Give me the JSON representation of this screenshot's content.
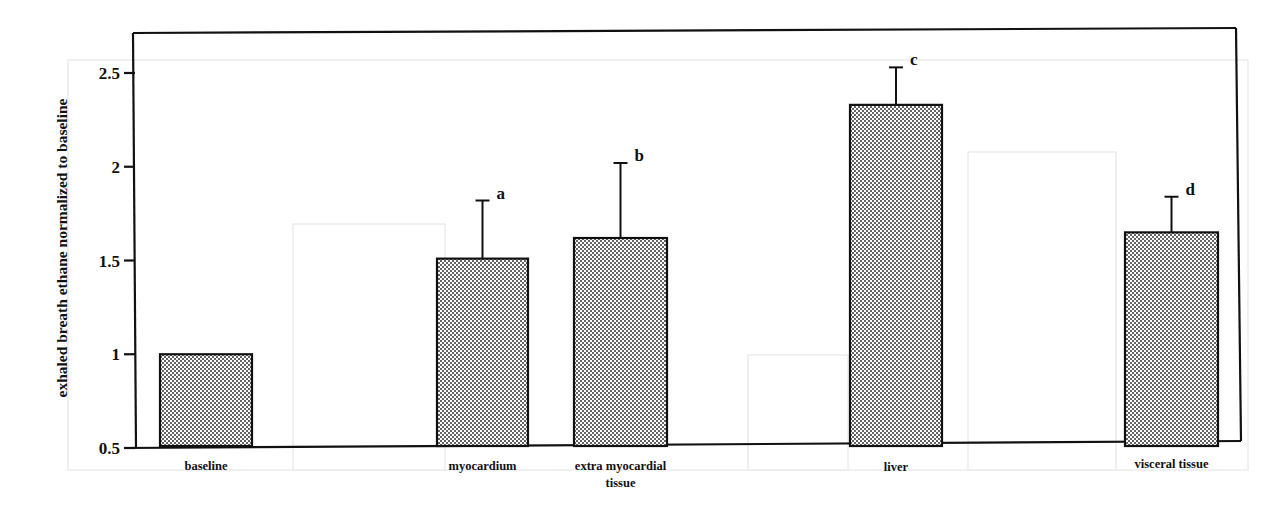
{
  "chart_data": {
    "type": "bar",
    "title": "",
    "xlabel": "",
    "ylabel": "exhaled breath ethane normalized to baseline",
    "ylim": [
      0.5,
      2.7
    ],
    "yticks": [
      0.5,
      1,
      1.5,
      2,
      2.5
    ],
    "ytick_labels": [
      "0.5",
      "1",
      "1.5",
      "2",
      "2.5"
    ],
    "grid": false,
    "legend": null,
    "categories": [
      "baseline",
      "myocardium",
      "extra myocardial tissue",
      "liver",
      "visceral tissue"
    ],
    "category_label_lines": [
      [
        "baseline"
      ],
      [
        "myocardium"
      ],
      [
        "extra myocardial",
        "tissue"
      ],
      [
        "liver"
      ],
      [
        "visceral tissue"
      ]
    ],
    "values": [
      1.0,
      1.51,
      1.62,
      2.33,
      1.65
    ],
    "error_upper": [
      null,
      1.82,
      2.02,
      2.53,
      1.84
    ],
    "error_sd": [
      0,
      0.31,
      0.4,
      0.2,
      0.19
    ],
    "significance_labels": [
      "",
      "a",
      "b",
      "c",
      "d"
    ],
    "bar_fill": "dotted-gray",
    "colors": {
      "bar_dots": "#222222",
      "bar_bg": "#ffffff",
      "outline": "#111111"
    }
  }
}
